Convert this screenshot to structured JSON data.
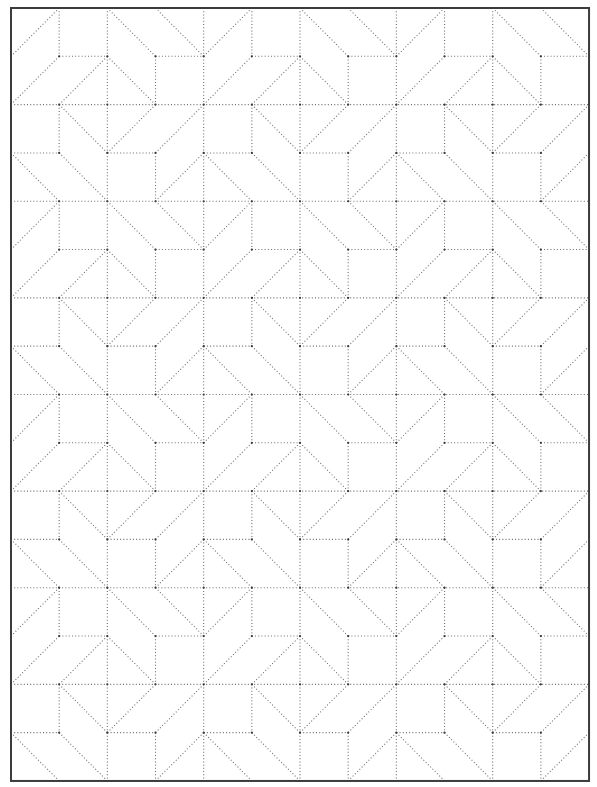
{
  "sheet": {
    "type": "dotted-line quilting pattern template",
    "background_color": "#ffffff",
    "line_color": "#6f6f6f",
    "node_color": "#3a3a3a",
    "frame_color": "#3c3c3c"
  },
  "grid": {
    "origin_x": 11,
    "origin_y": 8,
    "cols": 12,
    "rows": 16,
    "cell_w": 48.17,
    "cell_h": 48.31
  },
  "tile": {
    "period_rows": 4,
    "description": "12-column x 4-row repeating block; segments in [col,row] grid coordinates",
    "horizontals": [
      {
        "row": 0,
        "spans": [
          [
            0,
            12
          ]
        ]
      },
      {
        "row": 1,
        "spans": [
          [
            1,
            2
          ],
          [
            3,
            4
          ],
          [
            5,
            6
          ],
          [
            7,
            8
          ],
          [
            9,
            10
          ],
          [
            11,
            12
          ]
        ]
      },
      {
        "row": 2,
        "spans": [
          [
            0,
            12
          ]
        ]
      },
      {
        "row": 3,
        "spans": [
          [
            0,
            1
          ],
          [
            2,
            3
          ],
          [
            4,
            5
          ],
          [
            6,
            7
          ],
          [
            8,
            9
          ],
          [
            10,
            11
          ]
        ]
      }
    ],
    "verticals": [
      {
        "band": 0,
        "cols": [
          1,
          2,
          4,
          5,
          6,
          8,
          9,
          10
        ]
      },
      {
        "band": 1,
        "cols": [
          2,
          3,
          4,
          6,
          7,
          8,
          10,
          11
        ]
      },
      {
        "band": 2,
        "cols": [
          1,
          2,
          4,
          5,
          6,
          8,
          9,
          10
        ]
      },
      {
        "band": 3,
        "cols": [
          2,
          3,
          4,
          6,
          7,
          8,
          10,
          11
        ]
      }
    ],
    "diagonals": [
      [
        [
          0,
          1
        ],
        [
          1,
          0
        ]
      ],
      [
        [
          2,
          0
        ],
        [
          3,
          1
        ]
      ],
      [
        [
          3,
          0
        ],
        [
          4,
          1
        ]
      ],
      [
        [
          5,
          0
        ],
        [
          4,
          1
        ]
      ],
      [
        [
          6,
          0
        ],
        [
          7,
          1
        ]
      ],
      [
        [
          7,
          0
        ],
        [
          8,
          1
        ]
      ],
      [
        [
          9,
          0
        ],
        [
          8,
          1
        ]
      ],
      [
        [
          10,
          0
        ],
        [
          11,
          1
        ]
      ],
      [
        [
          11,
          0
        ],
        [
          12,
          1
        ]
      ],
      [
        [
          0,
          2
        ],
        [
          1,
          1
        ]
      ],
      [
        [
          1,
          2
        ],
        [
          2,
          1
        ]
      ],
      [
        [
          2,
          1
        ],
        [
          3,
          2
        ]
      ],
      [
        [
          4,
          2
        ],
        [
          5,
          1
        ]
      ],
      [
        [
          5,
          2
        ],
        [
          6,
          1
        ]
      ],
      [
        [
          6,
          1
        ],
        [
          7,
          2
        ]
      ],
      [
        [
          8,
          2
        ],
        [
          9,
          1
        ]
      ],
      [
        [
          9,
          2
        ],
        [
          10,
          1
        ]
      ],
      [
        [
          10,
          1
        ],
        [
          11,
          2
        ]
      ],
      [
        [
          1,
          2
        ],
        [
          2,
          3
        ]
      ],
      [
        [
          3,
          2
        ],
        [
          2,
          3
        ]
      ],
      [
        [
          4,
          2
        ],
        [
          3,
          3
        ]
      ],
      [
        [
          5,
          2
        ],
        [
          6,
          3
        ]
      ],
      [
        [
          7,
          2
        ],
        [
          6,
          3
        ]
      ],
      [
        [
          8,
          2
        ],
        [
          7,
          3
        ]
      ],
      [
        [
          9,
          2
        ],
        [
          10,
          3
        ]
      ],
      [
        [
          11,
          2
        ],
        [
          10,
          3
        ]
      ],
      [
        [
          12,
          2
        ],
        [
          11,
          3
        ]
      ],
      [
        [
          0,
          3
        ],
        [
          1,
          4
        ]
      ],
      [
        [
          1,
          3
        ],
        [
          2,
          4
        ]
      ],
      [
        [
          3,
          4
        ],
        [
          4,
          3
        ]
      ],
      [
        [
          4,
          3
        ],
        [
          5,
          4
        ]
      ],
      [
        [
          5,
          3
        ],
        [
          6,
          4
        ]
      ],
      [
        [
          7,
          4
        ],
        [
          8,
          3
        ]
      ],
      [
        [
          8,
          3
        ],
        [
          9,
          4
        ]
      ],
      [
        [
          9,
          3
        ],
        [
          10,
          4
        ]
      ],
      [
        [
          11,
          4
        ],
        [
          12,
          3
        ]
      ]
    ]
  }
}
